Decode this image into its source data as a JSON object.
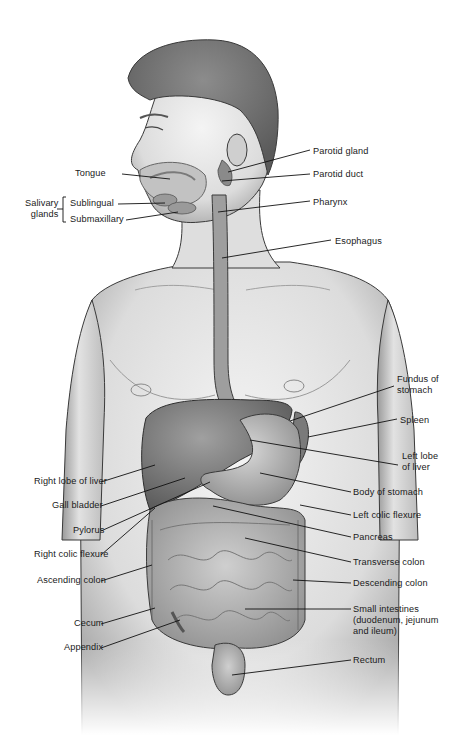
{
  "diagram": {
    "labels_left": [
      {
        "id": "tongue",
        "text": "Tongue",
        "x": 75,
        "y": 168,
        "line": [
          122,
          174,
          170,
          179
        ]
      },
      {
        "id": "sublingual",
        "text": "Sublingual",
        "x": 70,
        "y": 198,
        "line": [
          118,
          204,
          165,
          203
        ]
      },
      {
        "id": "submaxillary",
        "text": "Submaxillary",
        "x": 70,
        "y": 214,
        "line": [
          126,
          220,
          178,
          212
        ]
      },
      {
        "id": "right-lobe-of-liver",
        "text": "Right lobe of liver",
        "x": 34,
        "y": 476,
        "line": [
          101,
          482,
          155,
          465
        ]
      },
      {
        "id": "gall-bladder",
        "text": "Gall bladder",
        "x": 52,
        "y": 500,
        "line": [
          101,
          506,
          185,
          478
        ]
      },
      {
        "id": "pylorus",
        "text": "Pylorus",
        "x": 73,
        "y": 525,
        "line": [
          101,
          531,
          210,
          482
        ]
      },
      {
        "id": "right-colic-flexure",
        "text": "Right colic flexure",
        "x": 34,
        "y": 549,
        "line": [
          101,
          555,
          155,
          508
        ]
      },
      {
        "id": "ascending-colon",
        "text": "Ascending colon",
        "x": 37,
        "y": 575,
        "line": [
          101,
          581,
          152,
          565
        ]
      },
      {
        "id": "cecum",
        "text": "Cecum",
        "x": 74,
        "y": 618,
        "line": [
          101,
          624,
          155,
          608
        ]
      },
      {
        "id": "appendix",
        "text": "Appendix",
        "x": 64,
        "y": 642,
        "line": [
          101,
          648,
          180,
          620
        ]
      }
    ],
    "salivary_group": {
      "text": "Salivary\nglands",
      "x": 25,
      "y": 198
    },
    "labels_right": [
      {
        "id": "parotid-gland",
        "text": "Parotid gland",
        "x": 313,
        "y": 146,
        "line": [
          310,
          150,
          228,
          172
        ]
      },
      {
        "id": "parotid-duct",
        "text": "Parotid duct",
        "x": 313,
        "y": 169,
        "line": [
          310,
          174,
          222,
          181
        ]
      },
      {
        "id": "pharynx",
        "text": "Pharynx",
        "x": 313,
        "y": 197,
        "line": [
          310,
          201,
          218,
          212
        ]
      },
      {
        "id": "esophagus",
        "text": "Esophagus",
        "x": 335,
        "y": 236,
        "line": [
          331,
          240,
          222,
          258
        ]
      },
      {
        "id": "fundus-of-stomach",
        "text": "Fundus of\nstomach",
        "x": 397,
        "y": 374,
        "line": [
          394,
          386,
          290,
          421
        ]
      },
      {
        "id": "spleen",
        "text": "Spleen",
        "x": 400,
        "y": 415,
        "line": [
          397,
          419,
          308,
          437
        ]
      },
      {
        "id": "left-lobe-of-liver",
        "text": "Left lobe\nof liver",
        "x": 402,
        "y": 451,
        "line": [
          398,
          465,
          250,
          440
        ]
      },
      {
        "id": "body-of-stomach",
        "text": "Body of stomach",
        "x": 353,
        "y": 487,
        "line": [
          351,
          492,
          260,
          473
        ]
      },
      {
        "id": "left-colic-flexure",
        "text": "Left colic flexure",
        "x": 353,
        "y": 510,
        "line": [
          351,
          515,
          300,
          505
        ]
      },
      {
        "id": "pancreas",
        "text": "Pancreas",
        "x": 353,
        "y": 532,
        "line": [
          351,
          537,
          213,
          506
        ]
      },
      {
        "id": "transverse-colon",
        "text": "Transverse colon",
        "x": 353,
        "y": 557,
        "line": [
          351,
          562,
          245,
          538
        ]
      },
      {
        "id": "descending-colon",
        "text": "Descending colon",
        "x": 353,
        "y": 578,
        "line": [
          351,
          583,
          293,
          580
        ]
      },
      {
        "id": "small-intestines",
        "text": "Small intestines\n(duodenum, jejunum\nand ileum)",
        "x": 353,
        "y": 604,
        "line": [
          351,
          609,
          245,
          609
        ]
      },
      {
        "id": "rectum",
        "text": "Rectum",
        "x": 353,
        "y": 655,
        "line": [
          351,
          660,
          232,
          675
        ]
      }
    ]
  },
  "colors": {
    "outline": "#3a3a3a",
    "skin": "#e8e8e8",
    "skin_shadow": "#b8b8b8",
    "hair": "#6e6e6e",
    "organ": "#8a8a8a",
    "organ_light": "#c9c9c9",
    "label_text": "#1a1a1a",
    "leader_line": "#111111"
  }
}
